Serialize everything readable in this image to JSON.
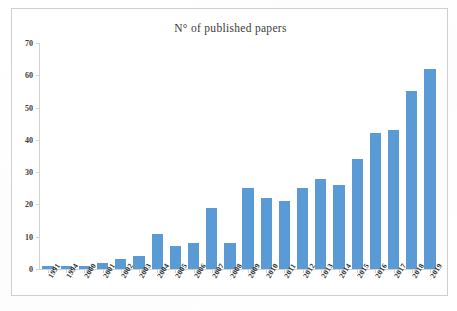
{
  "chart_data": {
    "type": "bar",
    "title": "N° of published papers",
    "xlabel": "",
    "ylabel": "",
    "ylim": [
      0,
      70
    ],
    "y_ticks": [
      0,
      10,
      20,
      30,
      40,
      50,
      60,
      70
    ],
    "grid": false,
    "legend": false,
    "bar_color": "#5b9bd5",
    "categories": [
      "1991",
      "1994",
      "2000",
      "2001",
      "2002",
      "2003",
      "2004",
      "2005",
      "2006",
      "2007",
      "2008",
      "2009",
      "2010",
      "2011",
      "2012",
      "2013",
      "2014",
      "2015",
      "2016",
      "2017",
      "2018",
      "2019"
    ],
    "values": [
      1,
      1,
      1,
      2,
      3,
      4,
      11,
      7,
      8,
      19,
      8,
      25,
      22,
      21,
      25,
      28,
      26,
      34,
      42,
      43,
      55,
      62
    ],
    "series": [
      {
        "name": "N° of published papers",
        "values": [
          1,
          1,
          1,
          2,
          3,
          4,
          11,
          7,
          8,
          19,
          8,
          25,
          22,
          21,
          25,
          28,
          26,
          34,
          42,
          43,
          55,
          62
        ]
      }
    ]
  },
  "figure": {
    "border_color": "#cfcfcf",
    "background": "#ffffff",
    "axis_color": "#d2d2d2"
  }
}
